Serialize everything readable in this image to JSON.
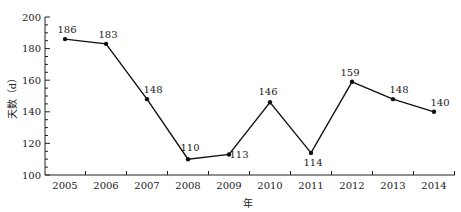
{
  "chart_data": {
    "type": "line",
    "title": "",
    "xlabel": "年",
    "ylabel": "天数（d）",
    "categories": [
      "2005",
      "2006",
      "2007",
      "2008",
      "2009",
      "2010",
      "2011",
      "2012",
      "2013",
      "2014"
    ],
    "values": [
      186,
      183,
      148,
      110,
      113,
      146,
      114,
      159,
      148,
      140
    ],
    "ylim": [
      100,
      200
    ],
    "yticks": [
      100,
      120,
      140,
      160,
      180,
      200
    ],
    "grid": false,
    "legend": null,
    "line_color": "#111111"
  }
}
